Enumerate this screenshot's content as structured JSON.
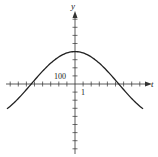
{
  "chart_data": {
    "type": "line",
    "title": "",
    "xlabel": "t",
    "ylabel": "y",
    "annotations": {
      "x_tick_label": "1",
      "y_tick_label": "100"
    },
    "x_tick_step": 1,
    "y_tick_step": 100,
    "xlim": [
      -8.5,
      8.5
    ],
    "ylim": [
      -900,
      900
    ],
    "grid": false,
    "series": [
      {
        "name": "curve",
        "x": [
          -8.4,
          -7,
          -6,
          -5.4,
          -4,
          -3,
          -2,
          -1,
          0,
          1,
          2,
          3,
          4,
          5.4,
          6,
          7,
          8.4
        ],
        "y": [
          -500,
          -330,
          -190,
          0,
          160,
          270,
          350,
          390,
          400,
          390,
          350,
          270,
          160,
          0,
          -190,
          -330,
          -500
        ]
      }
    ]
  },
  "labels": {
    "x_axis": "t",
    "y_axis": "y",
    "y_tick": "100",
    "x_tick": "1"
  }
}
